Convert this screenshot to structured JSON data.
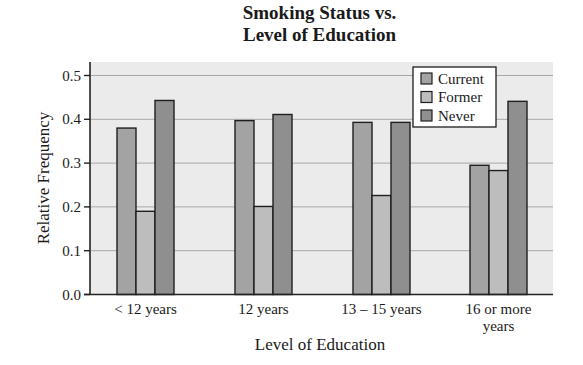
{
  "chart_data": {
    "type": "bar",
    "title_lines": [
      "Smoking Status vs.",
      "Level of Education"
    ],
    "xlabel": "Level of Education",
    "ylabel": "Relative Frequency",
    "categories": [
      "< 12 years",
      "12 years",
      "13 – 15 years",
      "16 or more years"
    ],
    "category_label_lines": [
      [
        "< 12 years"
      ],
      [
        "12 years"
      ],
      [
        "13 – 15 years"
      ],
      [
        "16 or more",
        "years"
      ]
    ],
    "series": [
      {
        "name": "Current",
        "color": "#a3a3a3",
        "values": [
          0.38,
          0.397,
          0.393,
          0.295
        ]
      },
      {
        "name": "Former",
        "color": "#bdbdbd",
        "values": [
          0.19,
          0.201,
          0.226,
          0.283
        ]
      },
      {
        "name": "Never",
        "color": "#8f8f8f",
        "values": [
          0.443,
          0.411,
          0.393,
          0.441
        ]
      }
    ],
    "ylim": [
      0,
      0.53
    ],
    "yticks": [
      "0.0",
      "0.1",
      "0.2",
      "0.3",
      "0.4",
      "0.5"
    ],
    "ytick_values": [
      0,
      0.1,
      0.2,
      0.3,
      0.4,
      0.5
    ],
    "grid": true,
    "legend_position": "upper right",
    "plot_background": "#ebebeb"
  }
}
